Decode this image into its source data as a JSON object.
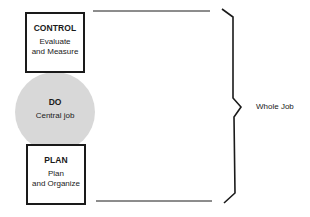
{
  "diagram": {
    "type": "cycle-stack",
    "nodes": [
      {
        "id": "control",
        "shape": "box",
        "title": "CONTROL",
        "subtitle": "Evaluate and Measure",
        "subtitle_lines": [
          "Evaluate",
          "and Measure"
        ]
      },
      {
        "id": "do",
        "shape": "circle",
        "title": "DO",
        "subtitle": "Central job",
        "fill": "#d8d8d8"
      },
      {
        "id": "plan",
        "shape": "box",
        "title": "PLAN",
        "subtitle": "Plan and Organize",
        "subtitle_lines": [
          "Plan",
          "and Organize"
        ]
      }
    ],
    "bracket": {
      "label": "Whole Job",
      "spans": [
        "control",
        "do",
        "plan"
      ]
    },
    "colors": {
      "stroke": "#1a1a1a",
      "circle_fill": "#d8d8d8",
      "background": "#ffffff"
    }
  }
}
